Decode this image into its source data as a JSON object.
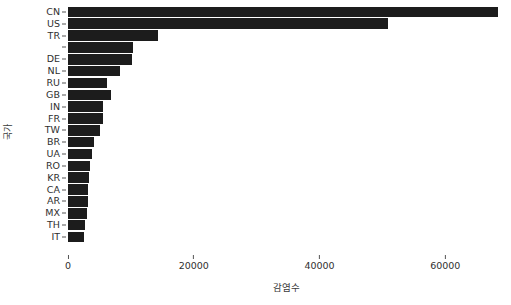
{
  "chart_data": {
    "type": "bar",
    "orientation": "horizontal",
    "title": "",
    "xlabel": "감염수",
    "ylabel": "국가",
    "grid": false,
    "legend": null,
    "xlim": [
      0,
      69500
    ],
    "xticks": [
      0,
      20000,
      40000,
      60000
    ],
    "xtick_labels": [
      "0",
      "20000",
      "40000",
      "60000"
    ],
    "categories": [
      "CN",
      "US",
      "TR",
      "",
      "DE",
      "NL",
      "RU",
      "GB",
      "IN",
      "FR",
      "TW",
      "BR",
      "UA",
      "RO",
      "KR",
      "CA",
      "AR",
      "MX",
      "TH",
      "IT"
    ],
    "values": [
      68400,
      50900,
      14300,
      10300,
      10200,
      8250,
      6250,
      6800,
      5600,
      5550,
      5100,
      4150,
      3800,
      3500,
      3350,
      3200,
      3150,
      3050,
      2750,
      2600
    ],
    "bar_color": "#1c1c1c",
    "background_color": "#ffffff"
  },
  "axes": {
    "y_title": "국가",
    "x_title": "감염수"
  }
}
